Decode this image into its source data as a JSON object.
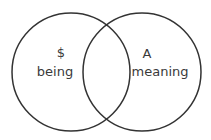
{
  "diagram": {
    "type": "venn",
    "stroke_color": "#333333",
    "text_color": "#3a3a3a",
    "sets": [
      {
        "symbol": "$",
        "label": "being"
      },
      {
        "symbol": "A",
        "label": "meaning"
      }
    ]
  }
}
